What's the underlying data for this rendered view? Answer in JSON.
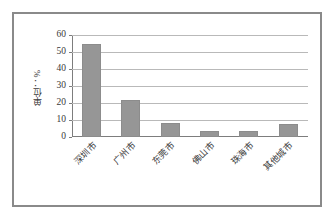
{
  "chart_data": {
    "type": "bar",
    "title": "",
    "subtitle": "",
    "xlabel": "",
    "ylabel": "单位：%",
    "categories": [
      "深圳市",
      "广州市",
      "东莞市",
      "佛山市",
      "珠海市",
      "其他城市"
    ],
    "values": [
      55,
      22,
      8,
      3.5,
      3.5,
      7.5
    ],
    "ylim": [
      0,
      60
    ],
    "ytick_labels": [
      "60",
      "50",
      "40",
      "30",
      "20",
      "10",
      "0"
    ],
    "ytick_values": [
      60,
      50,
      40,
      30,
      20,
      10,
      0
    ],
    "ystep": 10,
    "grid": true,
    "legend": false,
    "legend_position": "none",
    "bar_color": "#969696",
    "gridline_color": "#b9b9b9",
    "axis_color": "#7d7d7d",
    "plot_background": "#ffffff",
    "frame_border_color": "#8a8a8a",
    "xtick_label_rotation": -45
  }
}
